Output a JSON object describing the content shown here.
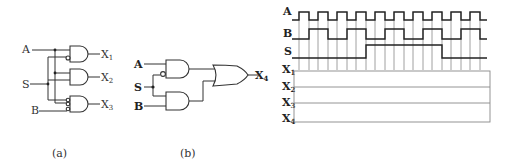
{
  "circuit_a": {
    "inputs": [
      "A",
      "S",
      "B"
    ],
    "outputs": [
      {
        "name": "X",
        "sub": "1"
      },
      {
        "name": "X",
        "sub": "2"
      },
      {
        "name": "X",
        "sub": "3"
      }
    ],
    "caption": "(a)"
  },
  "circuit_b": {
    "inputs": [
      "A",
      "S",
      "B"
    ],
    "output": {
      "name": "X",
      "sub": "4"
    },
    "caption": "(b)"
  },
  "timing": {
    "signals": [
      "A",
      "B",
      "S"
    ],
    "outputs": [
      {
        "name": "X",
        "sub": "1"
      },
      {
        "name": "X",
        "sub": "2"
      },
      {
        "name": "X",
        "sub": "3"
      },
      {
        "name": "X",
        "sub": "4"
      }
    ]
  },
  "colors": {
    "line": "#333333",
    "grid": "#888888",
    "background": "#ffffff"
  }
}
